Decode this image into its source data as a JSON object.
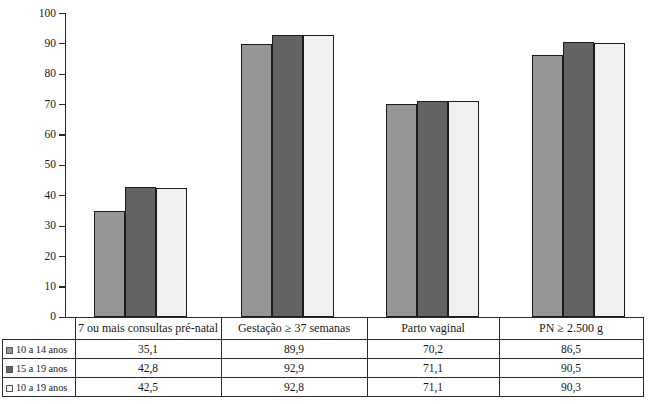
{
  "chart_data": {
    "type": "bar",
    "title": "",
    "subtitle": "",
    "xlabel": "",
    "ylabel": "",
    "ylim": [
      0,
      100
    ],
    "ytick_step": 10,
    "yticks": [
      100,
      90,
      80,
      70,
      60,
      50,
      40,
      30,
      20,
      10,
      0
    ],
    "ytick_labels": [
      "100",
      "90",
      "80",
      "70",
      "60",
      "50",
      "40",
      "30",
      "20",
      "10",
      "0"
    ],
    "grid": false,
    "legend_position": "table-first-column",
    "categories": [
      "7 ou mais consultas pré-natal",
      "Gestação ≥ 37 semanas",
      "Parto vaginal",
      "PN ≥ 2.500 g"
    ],
    "series": [
      {
        "name": "10 a 14 anos",
        "color": "#969696",
        "values": [
          35.1,
          89.9,
          70.2,
          86.5
        ],
        "value_labels": [
          "35,1",
          "89,9",
          "70,2",
          "86,5"
        ]
      },
      {
        "name": "15 a 19 anos",
        "color": "#636363",
        "values": [
          42.8,
          92.9,
          71.1,
          90.5
        ],
        "value_labels": [
          "42,8",
          "92,9",
          "71,1",
          "90,5"
        ]
      },
      {
        "name": "10 a 19 anos",
        "color": "#f0f0f0",
        "values": [
          42.5,
          92.8,
          71.1,
          90.3
        ],
        "value_labels": [
          "42,5",
          "92,8",
          "71,1",
          "90,3"
        ]
      }
    ]
  },
  "table": {
    "row_header_labels": [
      "10 a 14 anos",
      "15 a 19 anos",
      "10 a 19 anos"
    ],
    "column_headers": [
      "7 ou mais consultas pré-natal",
      "Gestação ≥ 37 semanas",
      "Parto vaginal",
      "PN ≥ 2.500 g"
    ],
    "rows": [
      [
        "35,1",
        "89,9",
        "70,2",
        "86,5"
      ],
      [
        "42,8",
        "92,9",
        "71,1",
        "90,5"
      ],
      [
        "42,5",
        "92,8",
        "71,1",
        "90,3"
      ]
    ]
  },
  "source_note": ""
}
